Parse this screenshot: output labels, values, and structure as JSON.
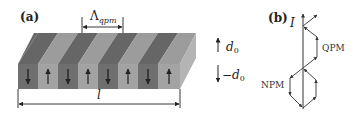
{
  "figure": {
    "panel_a": {
      "label": "(a)",
      "period_label": "Λ",
      "period_subscript": "qpm",
      "length_label": "l",
      "domain_up_label": "d",
      "domain_up_sub": "0",
      "domain_down_label": "−d",
      "domain_down_sub": "0",
      "segments": [
        "down",
        "up",
        "down",
        "up",
        "down",
        "up",
        "down",
        "up"
      ],
      "colors": {
        "dark_front": "#6f6f6f",
        "light_front": "#a3a3a3",
        "dark_top": "#666666",
        "light_top": "#9c9c9c",
        "side": "#b4b4b4",
        "arrow": "#111111"
      }
    },
    "panel_b": {
      "label": "(b)",
      "intensity_label": "I",
      "qpm_label": "QPM",
      "npm_label": "NPM",
      "line_color": "#333333"
    }
  }
}
